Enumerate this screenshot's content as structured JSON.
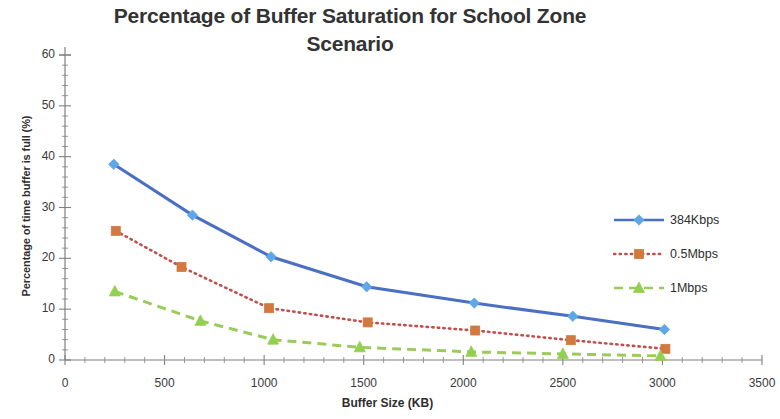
{
  "chart_data": {
    "type": "line",
    "title": "Percentage of Buffer Saturation for School Zone Scenario",
    "xlabel": "Buffer Size (KB)",
    "ylabel": "Percentage of time buffer is full (%)",
    "xlim": [
      0,
      3500
    ],
    "ylim": [
      0,
      60
    ],
    "xticks": [
      0,
      500,
      1000,
      1500,
      2000,
      2500,
      3000,
      3500
    ],
    "yticks": [
      0,
      10,
      20,
      30,
      40,
      50,
      60
    ],
    "x_minor_tick_step": 100,
    "y_minor_tick_step": 2,
    "grid": false,
    "legend_position": "right",
    "series": [
      {
        "name": "384Kbps",
        "color": "#4a6fc4",
        "marker": "diamond",
        "marker_color": "#5fa8e8",
        "line_style": "solid",
        "x": [
          245,
          640,
          1035,
          1515,
          2055,
          2550,
          3010
        ],
        "y": [
          38.5,
          28.5,
          20.3,
          14.4,
          11.2,
          8.6,
          6.0
        ]
      },
      {
        "name": "0.5Mbps",
        "color": "#c0504d",
        "marker": "square",
        "marker_color": "#d2793f",
        "line_style": "dotted",
        "x": [
          255,
          585,
          1025,
          1520,
          2060,
          2540,
          3015
        ],
        "y": [
          25.4,
          18.3,
          10.2,
          7.4,
          5.8,
          3.9,
          2.2
        ]
      },
      {
        "name": "1Mbps",
        "color": "#9bcb5c",
        "marker": "triangle",
        "marker_color": "#92d050",
        "line_style": "dashed",
        "x": [
          250,
          680,
          1045,
          1480,
          2040,
          2500,
          2990
        ],
        "y": [
          13.5,
          7.7,
          4.0,
          2.5,
          1.6,
          1.2,
          0.8
        ]
      }
    ]
  }
}
